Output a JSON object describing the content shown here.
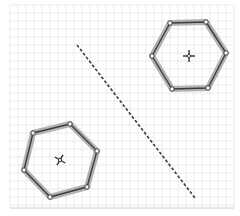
{
  "diagram": {
    "type": "geometry-grid",
    "canvas": {
      "width": 240,
      "height": 216
    },
    "grid": {
      "x0": 10,
      "y0": 5,
      "x1": 234,
      "y1": 208,
      "spacing": 8,
      "minor_color": "#e6e6e6",
      "major_color": "#d9d9d9",
      "border_color": "#cfcfcf"
    },
    "colors": {
      "edge": "#3c3c3c",
      "edge_halo": "#9a9a9a",
      "vertex_fill": "#ffffff",
      "vertex_stroke": "#3c3c3c",
      "dashed_line": "#3c3c3c",
      "center_marker": "#2e2e2e"
    },
    "shapes": [
      {
        "name": "hexagon-top-right",
        "points": "170,23 206,22 226,53 208,88 172,89 152,56",
        "vertices": [
          [
            170,
            23
          ],
          [
            206,
            22
          ],
          [
            226,
            53
          ],
          [
            208,
            88
          ],
          [
            172,
            89
          ],
          [
            152,
            56
          ]
        ],
        "center": [
          189,
          56
        ],
        "center_marker_rotation": 0
      },
      {
        "name": "hexagon-bottom-left",
        "points": "33,133 70,124 97,151 87,187 50,197 24,170",
        "vertices": [
          [
            33,
            133
          ],
          [
            70,
            124
          ],
          [
            97,
            151
          ],
          [
            87,
            187
          ],
          [
            50,
            197
          ],
          [
            24,
            170
          ]
        ],
        "center": [
          60,
          160
        ],
        "center_marker_rotation": 30
      }
    ],
    "separator": {
      "name": "dashed-separator-line",
      "x1": 77,
      "y1": 45,
      "x2": 195,
      "y2": 198,
      "dash": "3,2"
    }
  }
}
